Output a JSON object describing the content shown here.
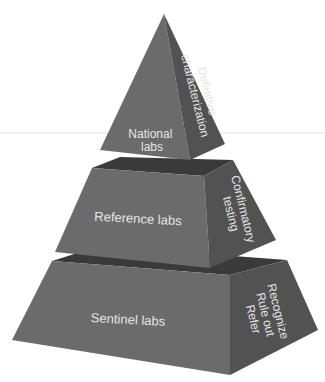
{
  "diagram": {
    "type": "tiered-pyramid",
    "colors": {
      "front_face": "#6b6b6b",
      "side_face": "#525252",
      "top_face": "#3a3a3a",
      "label": "#e6e6e6",
      "background": "#ffffff"
    },
    "tiers": [
      {
        "level": "top",
        "front_label_lines": [
          "National",
          "labs"
        ],
        "side_label_lines": [
          "Definitive",
          "characterization"
        ]
      },
      {
        "level": "middle",
        "front_label_lines": [
          "Reference labs"
        ],
        "side_label_lines": [
          "Confirmatory",
          "testing"
        ]
      },
      {
        "level": "bottom",
        "front_label_lines": [
          "Sentinel labs"
        ],
        "side_label_lines": [
          "Recognize",
          "Rule out",
          "Refer"
        ]
      }
    ]
  }
}
